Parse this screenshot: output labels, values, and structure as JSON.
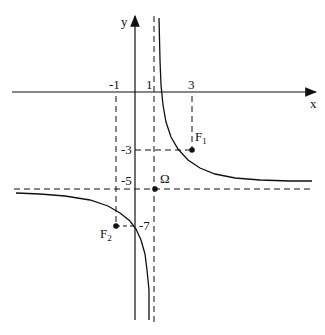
{
  "diagram": {
    "axes": {
      "x_label": "x",
      "y_label": "y"
    },
    "ticks": {
      "x_minus1": "-1",
      "x_1": "1",
      "x_3": "3",
      "y_minus3": "-3",
      "y_minus5": "-5",
      "y_minus7": "-7"
    },
    "points": {
      "F1": {
        "name": "F",
        "sub": "1",
        "x": 3,
        "y": -3
      },
      "F2": {
        "name": "F",
        "sub": "2",
        "x": -1,
        "y": -7
      },
      "Omega": {
        "name": "Ω",
        "x": 1,
        "y": -5
      }
    },
    "asymptotes": {
      "vertical": "x = 1",
      "horizontal": "y = -5"
    },
    "curve": "y = -5 + 4/(x - 1)",
    "colors": {
      "ink": "#111111",
      "background": "#ffffff"
    }
  }
}
